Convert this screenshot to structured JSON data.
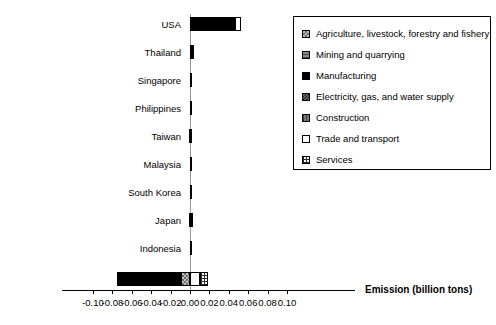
{
  "chart": {
    "type": "bar",
    "orientation": "horizontal",
    "stacked": true,
    "xlabel": "Emission (billion tons)",
    "title": "",
    "ylabel": "",
    "xlim": [
      -0.1,
      0.1
    ],
    "xticks": [
      "-0.10",
      "-0.08",
      "-0.06",
      "-0.04",
      "-0.02",
      "0.00",
      "0.02",
      "0.04",
      "0.06",
      "0.08",
      "0.10"
    ],
    "xtick_values": [
      -0.1,
      -0.08,
      -0.06,
      -0.04,
      -0.02,
      0.0,
      0.02,
      0.04,
      0.06,
      0.08,
      0.1
    ],
    "grid": false,
    "legend_position": "right-top"
  },
  "chart_data": {
    "type": "bar",
    "orientation": "horizontal",
    "stacked": true,
    "title": "",
    "xlabel": "Emission (billion tons)",
    "ylabel": "",
    "xlim": [
      -0.1,
      0.1
    ],
    "grid": false,
    "legend_position": "right-top",
    "categories": [
      "USA",
      "Thailand",
      "Singapore",
      "Philippines",
      "Taiwan",
      "Malaysia",
      "South Korea",
      "Japan",
      "Indonesia",
      "Total"
    ],
    "series": [
      {
        "name": "Agriculture, livestock, forestry and fishery",
        "key": "agri",
        "values": [
          0.0012,
          0.0,
          0.0,
          0.0,
          0.0,
          0.0,
          0.0,
          0.0,
          0.0,
          -0.0095
        ]
      },
      {
        "name": "Mining and quarrying",
        "key": "mine",
        "values": [
          0.0,
          0.0,
          0.0,
          0.0,
          -0.0008,
          0.0,
          -0.0004,
          -0.0008,
          0.0,
          -0.0014
        ]
      },
      {
        "name": "Manufacturing",
        "key": "manu",
        "values": [
          0.0456,
          0.0044,
          0.0012,
          0.0002,
          0.0012,
          0.001,
          0.0008,
          0.0012,
          0.0024,
          -0.064
        ]
      },
      {
        "name": "Electricity, gas, and water supply",
        "key": "elec",
        "values": [
          0.0,
          0.0,
          0.0,
          0.0,
          0.0,
          0.0,
          0.0,
          0.0004,
          0.0,
          -0.0008
        ]
      },
      {
        "name": "Construction",
        "key": "cons",
        "values": [
          0.0,
          0.0,
          0.0,
          0.0,
          0.0,
          0.0,
          0.0,
          0.0,
          0.0,
          0.0
        ]
      },
      {
        "name": "Trade and transport",
        "key": "trad",
        "values": [
          0.0054,
          0.0,
          0.0,
          0.0,
          0.0,
          0.0,
          0.0,
          0.0,
          0.0,
          0.01
        ]
      },
      {
        "name": "Services",
        "key": "serv",
        "values": [
          0.0,
          0.0,
          0.0,
          0.0,
          0.0,
          0.0,
          0.0,
          0.0,
          0.0,
          0.0088
        ]
      }
    ],
    "totals": [
      0.0522,
      0.0044,
      0.0012,
      0.0002,
      0.0004,
      0.001,
      0.0004,
      0.0008,
      0.0024,
      -0.0569
    ]
  },
  "legend": {
    "items": [
      {
        "label": "Agriculture, livestock, forestry and fishery",
        "key": "agri"
      },
      {
        "label": "Mining and quarrying",
        "key": "mine"
      },
      {
        "label": "Manufacturing",
        "key": "manu"
      },
      {
        "label": "Electricity, gas, and water supply",
        "key": "elec"
      },
      {
        "label": "Construction",
        "key": "cons"
      },
      {
        "label": "Trade and transport",
        "key": "trad"
      },
      {
        "label": "Services",
        "key": "serv"
      }
    ]
  }
}
